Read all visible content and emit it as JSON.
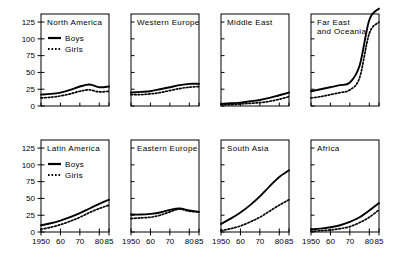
{
  "figure": {
    "background_color": "#ffffff",
    "line_color": "#000000",
    "legend": {
      "boys_label": "Boys",
      "girls_label": "Girls"
    },
    "y_ticks": [
      "0",
      "25",
      "50",
      "75",
      "100",
      "125"
    ],
    "x_ticks": [
      "1950",
      "60",
      "70",
      "80",
      "85"
    ]
  },
  "chart_data": {
    "type": "line",
    "title": "",
    "xlabel": "",
    "ylabel": "",
    "xlim": [
      1950,
      1985
    ],
    "ylim": [
      0,
      137
    ],
    "grid": false,
    "legend_position": "inside-top-left-panel",
    "y_ticks": [
      0,
      25,
      50,
      75,
      100,
      125
    ],
    "x_ticks": [
      1950,
      1960,
      1970,
      1980,
      1985
    ],
    "x_tick_labels": [
      "1950",
      "60",
      "70",
      "80",
      "85"
    ],
    "x": [
      1950,
      1955,
      1960,
      1965,
      1970,
      1975,
      1980,
      1985
    ],
    "panels": [
      {
        "title": "North America",
        "row": 0,
        "col": 0,
        "series": [
          {
            "name": "Boys",
            "values": [
              17,
              18,
              20,
              24,
              29,
              32,
              28,
              29
            ]
          },
          {
            "name": "Girls",
            "values": [
              12,
              13,
              15,
              18,
              22,
              24,
              21,
              22
            ]
          }
        ]
      },
      {
        "title": "Western Europe",
        "row": 0,
        "col": 1,
        "series": [
          {
            "name": "Boys",
            "values": [
              20,
              21,
              22,
              25,
              28,
              31,
              33,
              33
            ]
          },
          {
            "name": "Girls",
            "values": [
              17,
              17,
              18,
              20,
              23,
              26,
              28,
              29
            ]
          }
        ]
      },
      {
        "title": "Middle East",
        "row": 0,
        "col": 2,
        "series": [
          {
            "name": "Boys",
            "values": [
              3,
              4,
              5,
              7,
              9,
              12,
              16,
              20
            ]
          },
          {
            "name": "Girls",
            "values": [
              2,
              2,
              3,
              4,
              5,
              7,
              10,
              14
            ]
          }
        ]
      },
      {
        "title": "Far East and Oceania",
        "title_lines": [
          "Far East",
          "and Oceania"
        ],
        "row": 0,
        "col": 3,
        "series": [
          {
            "name": "Boys",
            "values": [
              22,
              25,
              28,
              31,
              35,
              60,
              128,
              145
            ]
          },
          {
            "name": "Girls",
            "values": [
              12,
              14,
              17,
              20,
              24,
              42,
              108,
              125
            ]
          }
        ]
      },
      {
        "title": "Latin America",
        "row": 1,
        "col": 0,
        "series": [
          {
            "name": "Boys",
            "values": [
              10,
              13,
              17,
              22,
              28,
              35,
              42,
              48
            ]
          },
          {
            "name": "Girls",
            "values": [
              4,
              7,
              11,
              16,
              22,
              29,
              35,
              40
            ]
          }
        ]
      },
      {
        "title": "Eastern Europe",
        "row": 1,
        "col": 1,
        "series": [
          {
            "name": "Boys",
            "values": [
              26,
              26,
              27,
              29,
              33,
              35,
              32,
              30
            ]
          },
          {
            "name": "Girls",
            "values": [
              20,
              21,
              22,
              25,
              30,
              34,
              31,
              30
            ]
          }
        ]
      },
      {
        "title": "South Asia",
        "row": 1,
        "col": 2,
        "series": [
          {
            "name": "Boys",
            "values": [
              12,
              20,
              29,
              40,
              53,
              68,
              82,
              92
            ]
          },
          {
            "name": "Girls",
            "values": [
              2,
              5,
              9,
              15,
              22,
              31,
              40,
              48
            ]
          }
        ]
      },
      {
        "title": "Africa",
        "row": 1,
        "col": 3,
        "series": [
          {
            "name": "Boys",
            "values": [
              4,
              5,
              7,
              10,
              15,
              22,
              32,
              43
            ]
          },
          {
            "name": "Girls",
            "values": [
              1,
              2,
              3,
              5,
              8,
              14,
              22,
              33
            ]
          }
        ]
      }
    ]
  }
}
